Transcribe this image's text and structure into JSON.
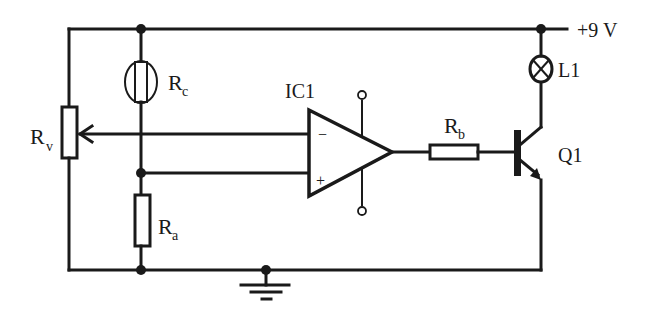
{
  "diagram": {
    "type": "circuit-schematic",
    "colors": {
      "ink": "#1a1a1a",
      "background": "#ffffff"
    },
    "supply": {
      "label": "+9 V"
    },
    "components": {
      "rv": {
        "label": "R",
        "sub": "v",
        "kind": "potentiometer"
      },
      "rc": {
        "label": "R",
        "sub": "c",
        "kind": "light-dependent-resistor"
      },
      "ra": {
        "label": "R",
        "sub": "a",
        "kind": "resistor"
      },
      "rb": {
        "label": "R",
        "sub": "b",
        "kind": "resistor"
      },
      "ic1": {
        "label": "IC1",
        "kind": "op-amp",
        "inverting": "−",
        "non_inverting": "+"
      },
      "q1": {
        "label": "Q1",
        "kind": "npn-transistor"
      },
      "l1": {
        "label": "L1",
        "kind": "lamp"
      },
      "ground": {
        "kind": "ground"
      }
    }
  }
}
